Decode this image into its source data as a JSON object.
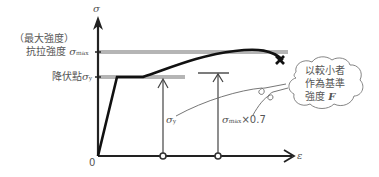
{
  "diagram": {
    "type": "stress-strain curve",
    "y_axis": {
      "symbol": "σ"
    },
    "x_axis": {
      "symbol": "ε",
      "origin_label": "0"
    },
    "labels": {
      "max_strength_paren": "（最大強度）",
      "tensile_strength": "抗拉強度",
      "sigma_max": "σ",
      "sigma_max_sub": "max",
      "yield_point": "降伏點",
      "sigma_y": "σ",
      "sigma_y_sub": "y",
      "arrow1_label_sigma": "σ",
      "arrow1_label_sub": "y",
      "arrow2_label_sigma": "σ",
      "arrow2_label_sub": "max",
      "arrow2_label_factor": "×0.7"
    },
    "callout": {
      "line1": "以較小者",
      "line2": "作為基準",
      "line3": "強度",
      "symbol": "F"
    },
    "colors": {
      "curve": "#111111",
      "axis": "#222222",
      "guide_band": "#b0b0b0",
      "text": "#555555"
    }
  }
}
